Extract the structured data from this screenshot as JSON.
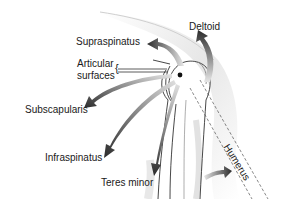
{
  "diagram": {
    "labels": {
      "deltoid": "Deltoid",
      "supraspinatus": "Supraspinatus",
      "articular_line1": "Articular",
      "articular_line2": "surfaces",
      "subscapularis": "Subscapularis",
      "infraspinatus": "Infraspinatus",
      "teres_minor": "Teres minor",
      "humerus": "Humerus"
    },
    "colors": {
      "arrow_dark": "#2b2b2b",
      "arrow_light": "#e0e0e0",
      "outline": "#333333",
      "shading": "#d8d8d8",
      "text": "#1a1a1a"
    }
  }
}
